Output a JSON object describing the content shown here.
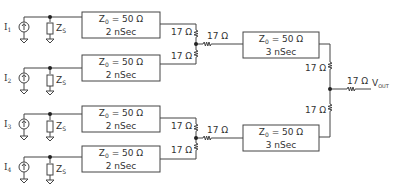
{
  "diagram": {
    "type": "circuit-schematic",
    "line_color": "#444444",
    "sources": [
      {
        "label": "I",
        "sub": "1",
        "shunt_label": "Z",
        "shunt_sub": "S"
      },
      {
        "label": "I",
        "sub": "2",
        "shunt_label": "Z",
        "shunt_sub": "S"
      },
      {
        "label": "I",
        "sub": "3",
        "shunt_label": "Z",
        "shunt_sub": "S"
      },
      {
        "label": "I",
        "sub": "4",
        "shunt_label": "Z",
        "shunt_sub": "S"
      }
    ],
    "first_stage_lines": [
      {
        "z_label": "Z",
        "z_sub": "0",
        "z_value": "= 50 Ω",
        "delay": "2 nSec"
      },
      {
        "z_label": "Z",
        "z_sub": "0",
        "z_value": "= 50 Ω",
        "delay": "2 nSec"
      },
      {
        "z_label": "Z",
        "z_sub": "0",
        "z_value": "= 50 Ω",
        "delay": "2 nSec"
      },
      {
        "z_label": "Z",
        "z_sub": "0",
        "z_value": "= 50 Ω",
        "delay": "2 nSec"
      }
    ],
    "second_stage_lines": [
      {
        "z_label": "Z",
        "z_sub": "0",
        "z_value": "= 50 Ω",
        "delay": "3 nSec"
      },
      {
        "z_label": "Z",
        "z_sub": "0",
        "z_value": "= 50 Ω",
        "delay": "3 nSec"
      }
    ],
    "resistor_label": "17 Ω",
    "output": {
      "label": "V",
      "sub": "OUT"
    }
  }
}
